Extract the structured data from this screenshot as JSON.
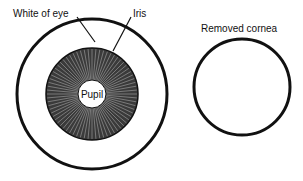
{
  "diagram": {
    "title": "",
    "eye": {
      "labels": {
        "white_of_eye": "White of eye",
        "iris": "Iris",
        "pupil": "Pupil"
      }
    },
    "cornea": {
      "label": "Removed cornea"
    },
    "colors": {
      "stroke": "#111111",
      "iris_fill": "#3a3a3a",
      "background": "#ffffff"
    }
  }
}
